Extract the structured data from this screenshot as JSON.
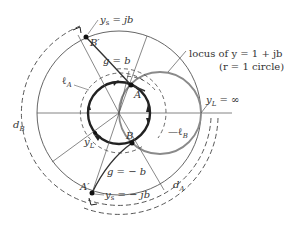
{
  "diagram": {
    "center": {
      "x": 119,
      "y": 113
    },
    "outer_radius": 82,
    "inner_circle_radius": 31,
    "r1_circle": {
      "cx": 160,
      "cy": 113,
      "r": 41
    },
    "colors": {
      "line": "#555555",
      "bold": "#222222",
      "grey_curve": "#8a8a8a",
      "dash": "#444444"
    },
    "labels": {
      "ys_top": "y",
      "ys_top_sub": "s",
      "ys_top_val": " = jb",
      "b_prime": "B′",
      "g_b": "g = b",
      "locus_line1": "locus of y = 1 + jb",
      "locus_line2": "(r = 1 circle)",
      "l_a": "ℓ",
      "l_a_sub": "A",
      "a_point": "A",
      "yl_inf": "y",
      "yl_inf_sub": "L",
      "yl_inf_val": " = ∞",
      "d_b": "d",
      "d_b_sub": "B",
      "yl": "y",
      "yl_sub": "L",
      "b_point": "B",
      "l_b": "ℓ",
      "l_b_sub": "B",
      "g_neg_b": "g = − b",
      "a_prime": "A′",
      "ys_bot": "y",
      "ys_bot_sub": "s",
      "ys_bot_val": " = − jb",
      "d_a": "d",
      "d_a_sub": "A"
    }
  }
}
